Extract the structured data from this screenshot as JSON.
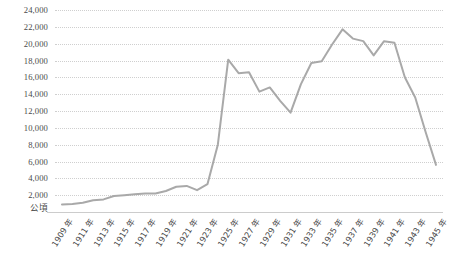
{
  "chart_data": {
    "type": "line",
    "title": "",
    "subtitle": "",
    "xlabel": "",
    "ylabel": "公頃",
    "y_unit_label": "公頃",
    "ylim": [
      0,
      24000
    ],
    "ytick_step": 2000,
    "grid": true,
    "legend": false,
    "legend_position": "none",
    "line_color": "#a9a9a9",
    "x_tick_suffix": "年",
    "x_tick_interval": 2,
    "yticks": [
      "24,000",
      "22,000",
      "20,000",
      "18,000",
      "16,000",
      "14,000",
      "12,000",
      "10,000",
      "8,000",
      "6,000",
      "4,000",
      "2,000"
    ],
    "ytick_values": [
      24000,
      22000,
      20000,
      18000,
      16000,
      14000,
      12000,
      10000,
      8000,
      6000,
      4000,
      2000
    ],
    "xticks": [
      "1909 年",
      "1911 年",
      "1913 年",
      "1915 年",
      "1917 年",
      "1919 年",
      "1921 年",
      "1923 年",
      "1925 年",
      "1927 年",
      "1929 年",
      "1931 年",
      "1933 年",
      "1935 年",
      "1937 年",
      "1939 年",
      "1941 年",
      "1943 年",
      "1945 年"
    ],
    "x": [
      1909,
      1910,
      1911,
      1912,
      1913,
      1914,
      1915,
      1916,
      1917,
      1918,
      1919,
      1920,
      1921,
      1922,
      1923,
      1924,
      1925,
      1926,
      1927,
      1928,
      1929,
      1930,
      1931,
      1932,
      1933,
      1934,
      1935,
      1936,
      1937,
      1938,
      1939,
      1940,
      1941,
      1942,
      1943,
      1944,
      1945
    ],
    "values": [
      900,
      950,
      1100,
      1400,
      1500,
      1900,
      2000,
      2100,
      2200,
      2200,
      2500,
      3000,
      3100,
      2600,
      3300,
      8000,
      18100,
      16500,
      16600,
      14300,
      14800,
      13200,
      11800,
      15200,
      17700,
      17900,
      19900,
      21700,
      20600,
      20300,
      18600,
      20300,
      20100,
      16000,
      13600,
      9500,
      5600
    ],
    "series": [
      {
        "name": "種植面積",
        "values": [
          900,
          950,
          1100,
          1400,
          1500,
          1900,
          2000,
          2100,
          2200,
          2200,
          2500,
          3000,
          3100,
          2600,
          3300,
          8000,
          18100,
          16500,
          16600,
          14300,
          14800,
          13200,
          11800,
          15200,
          17700,
          17900,
          19900,
          21700,
          20600,
          20300,
          18600,
          20300,
          20100,
          16000,
          13600,
          9500,
          5600
        ]
      }
    ]
  }
}
